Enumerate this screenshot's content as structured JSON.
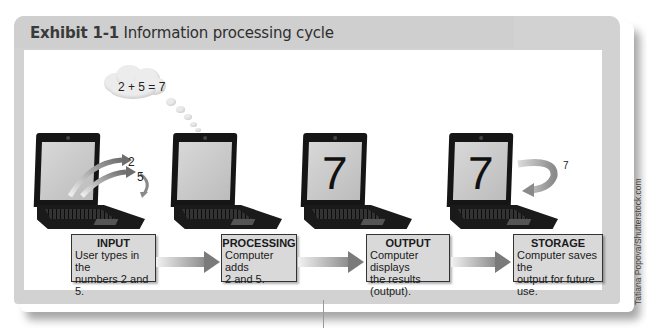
{
  "exhibit": {
    "label": "Exhibit 1-1",
    "title": "Information processing cycle"
  },
  "credit": "Tatiana Popova/Shutterstock.com",
  "thought_bubble": "2 + 5 = 7",
  "laptops": [
    {
      "stage": "input",
      "screen_text": "",
      "annotations": [
        "2",
        "5"
      ]
    },
    {
      "stage": "processing",
      "screen_text": "",
      "annotations": []
    },
    {
      "stage": "output",
      "screen_text": "7",
      "annotations": []
    },
    {
      "stage": "storage",
      "screen_text": "7",
      "annotations": [
        "7"
      ]
    }
  ],
  "steps": [
    {
      "title": "INPUT",
      "line1": "User types in the",
      "line2": "numbers 2 and 5."
    },
    {
      "title": "PROCESSING",
      "line1": "Computer adds",
      "line2": "2 and 5."
    },
    {
      "title": "OUTPUT",
      "line1": "Computer displays",
      "line2": "the results (output)."
    },
    {
      "title": "STORAGE",
      "line1": "Computer saves the",
      "line2": "output for future use."
    }
  ],
  "colors": {
    "frame": "#d2d2d2",
    "box_fill": "#d9d9d9",
    "arrow_dark": "#7a7a7a"
  }
}
